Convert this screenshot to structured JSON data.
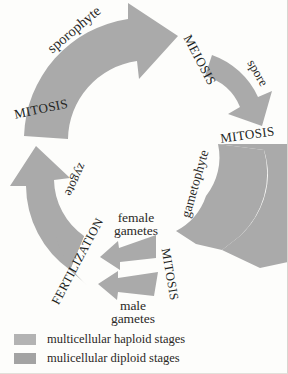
{
  "diagram": {
    "colors": {
      "haploid_fill": "#a9a9a9",
      "diploid_fill": "#a9a9a9",
      "background": "#fdfdfb",
      "text": "#2b2a28"
    },
    "labels": {
      "sporophyte": "sporophyte",
      "meiosis": "MEIOSIS",
      "spore": "spore",
      "mitosis_right": "MITOSIS",
      "gametophyte": "gametophyte",
      "mitosis_bottom": "MITOSIS",
      "female_gametes_line1": "female",
      "female_gametes_line2": "gametes",
      "male_gametes_line1": "male",
      "male_gametes_line2": "gametes",
      "fertilization": "FERTILIZATION",
      "zygote": "zygote",
      "mitosis_left": "MITOSIS"
    }
  },
  "legend": {
    "items": [
      {
        "label": "multicellular haploid stages",
        "color": "#b3b3b3"
      },
      {
        "label": "mulicellular diploid stages",
        "color": "#a3a3a3"
      }
    ]
  }
}
